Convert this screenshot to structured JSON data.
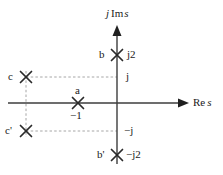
{
  "figure": {
    "type": "pole-zero-plot",
    "axes": {
      "imaginary_axis_label": "j Im s",
      "imaginary_axis_label_parts": {
        "j": "j",
        "im": "Im",
        "s": "s"
      },
      "real_axis_label": "Re s",
      "real_axis_label_parts": {
        "re": "Re",
        "s": "s"
      }
    },
    "tick_labels": {
      "pos_j2": "j2",
      "pos_j": "j",
      "neg_j": "−j",
      "neg_j2": "−j2",
      "neg_one": "−1"
    },
    "markers": [
      {
        "id": "b",
        "label": "b",
        "value_label": "j2",
        "symbol": "×",
        "x": 117,
        "y": 55
      },
      {
        "id": "c",
        "label": "c",
        "value_label": "j",
        "symbol": "×",
        "x": 26,
        "y": 77
      },
      {
        "id": "a",
        "label": "a",
        "value_label": "−1",
        "symbol": "×",
        "x": 78,
        "y": 103
      },
      {
        "id": "cprime",
        "label": "c'",
        "value_label": "−j",
        "symbol": "×",
        "x": 26,
        "y": 131
      },
      {
        "id": "bprime",
        "label": "b'",
        "value_label": "−j2",
        "symbol": "×",
        "x": 117,
        "y": 155
      }
    ],
    "colors": {
      "line": "#3d3d3d",
      "text": "#1a1a1a",
      "dashed": "#8a8a8a",
      "background": "#ffffff"
    }
  }
}
